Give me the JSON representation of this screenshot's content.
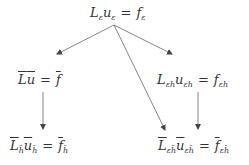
{
  "diagram": {
    "type": "tree",
    "nodes": [
      {
        "id": "root",
        "lhs_op": "L",
        "lhs_op_sub": "ε",
        "lhs_var": "u",
        "lhs_var_sub": "ε",
        "eq": "=",
        "rhs": "f",
        "rhs_sub": "ε",
        "bar": false
      },
      {
        "id": "left-mid",
        "lhs_op": "L",
        "lhs_op_sub": "",
        "lhs_var": "u",
        "lhs_var_sub": "",
        "eq": "=",
        "rhs": "f",
        "rhs_sub": "",
        "bar": true
      },
      {
        "id": "right-mid",
        "lhs_op": "L",
        "lhs_op_sub": "εh",
        "lhs_var": "u",
        "lhs_var_sub": "εh",
        "eq": "=",
        "rhs": "f",
        "rhs_sub": "εh",
        "bar": false
      },
      {
        "id": "left-bottom",
        "lhs_op": "L",
        "lhs_op_sub": "h̄",
        "lhs_var": "u",
        "lhs_var_sub": "h̄",
        "eq": "=",
        "rhs": "f",
        "rhs_sub": "h̄",
        "bar": true
      },
      {
        "id": "right-bottom",
        "lhs_op": "L",
        "lhs_op_sub": "εh̄",
        "lhs_var": "u",
        "lhs_var_sub": "εh̄",
        "eq": "=",
        "rhs": "f",
        "rhs_sub": "εh̄",
        "bar": true
      }
    ],
    "edges": [
      {
        "from": "root",
        "to": "left-mid"
      },
      {
        "from": "root",
        "to": "right-mid"
      },
      {
        "from": "root",
        "to": "right-bottom"
      },
      {
        "from": "left-mid",
        "to": "left-bottom"
      },
      {
        "from": "right-mid",
        "to": "right-bottom"
      }
    ],
    "line_color": "#555555",
    "text_color": "#333333"
  }
}
